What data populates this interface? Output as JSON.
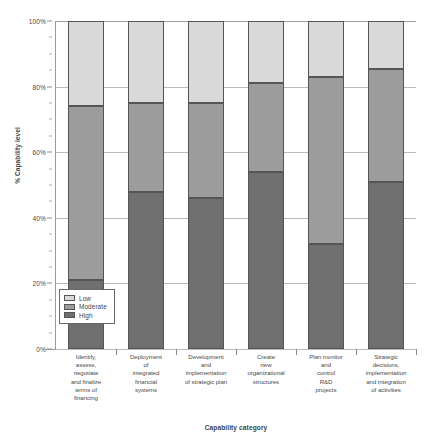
{
  "chart_data": {
    "type": "bar",
    "variant": "100% stacked column",
    "title": "",
    "xlabel": "Capability category",
    "ylabel": "% Capability level",
    "ylim": [
      0,
      100
    ],
    "ytick_labels": [
      "0%",
      "20%",
      "40%",
      "60%",
      "80%",
      "100%"
    ],
    "ytick_values": [
      0,
      20,
      40,
      60,
      80,
      100
    ],
    "grid": true,
    "legend_position": "inside bottom-left",
    "categories": [
      "Identify, assess, negotiate and finalize terms of financing",
      "Deployment of integrated financial systems",
      "Development and implementation of strategic plan",
      "Create new organizational structures",
      "Plan monitor and control R&D projects",
      "Strategic decisions, implementation and integration of activities"
    ],
    "category_lines": [
      [
        "Identify,",
        "assess,",
        "negotiate",
        "and finalize",
        "terms of",
        "financing"
      ],
      [
        "Deployment",
        "of",
        "integrated",
        "financial",
        "systems"
      ],
      [
        "Development",
        "and",
        "implementation",
        "of strategic plan"
      ],
      [
        "Create",
        "new",
        "organizational",
        "structures"
      ],
      [
        "Plan monitor",
        "and",
        "control",
        "R&D",
        "projects"
      ],
      [
        "Strategic",
        "decisions,",
        "implementation",
        "and integration",
        "of activities"
      ]
    ],
    "series": [
      {
        "name": "Low",
        "color": "#d9d9d9",
        "values": [
          26,
          25,
          25,
          19,
          17,
          14.5
        ]
      },
      {
        "name": "Moderate",
        "color": "#9c9c9c",
        "values": [
          53,
          27,
          29,
          27,
          51,
          34.5
        ]
      },
      {
        "name": "High",
        "color": "#6f6f6f",
        "values": [
          21,
          48,
          46,
          54,
          32,
          51
        ]
      }
    ],
    "stack_order_bottom_to_top": [
      "High",
      "Moderate",
      "Low"
    ],
    "cumulative_tops": {
      "high": [
        21,
        48,
        46,
        54,
        32,
        51
      ],
      "moderate": [
        74,
        75,
        75,
        81,
        83,
        85.5
      ],
      "low": [
        100,
        100,
        100,
        100,
        100,
        100
      ]
    }
  },
  "legend": {
    "items": [
      {
        "label": "Low",
        "color": "#d9d9d9"
      },
      {
        "label": "Moderate",
        "color": "#9c9c9c"
      },
      {
        "label": "High",
        "color": "#6f6f6f"
      }
    ]
  },
  "axes": {
    "y_title": "% Capability level",
    "x_title": "Capability category"
  },
  "caption_sliver": ""
}
